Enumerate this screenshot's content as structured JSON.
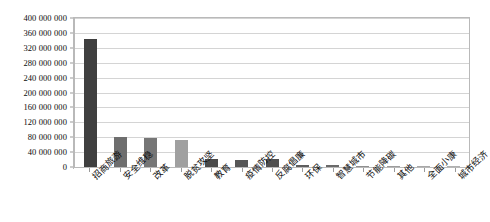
{
  "chart_data": {
    "type": "bar",
    "title": "",
    "subtitle": "",
    "xlabel": "",
    "ylabel": "",
    "categories": [
      "招商旅游",
      "安全维稳",
      "改革",
      "脱贫攻坚",
      "教育",
      "疫情防控",
      "反腐倡廉",
      "环保",
      "智慧城市",
      "节能降碳",
      "其他",
      "全面小康",
      "城市经济"
    ],
    "values": [
      345000000,
      80000000,
      79000000,
      73000000,
      21000000,
      20000000,
      21000000,
      6000000,
      4500000,
      1800000,
      900000,
      600000,
      400000
    ],
    "ylim": [
      0,
      400000000
    ],
    "ytick_step": 40000000,
    "ytick_labels": [
      "400 000 000",
      "360 000 000",
      "320 000 000",
      "280 000 000",
      "240 000 000",
      "200 000 000",
      "160 000 000",
      "120 000 000",
      "80 000 000",
      "40 000 000",
      "0"
    ],
    "ytick_values": [
      400000000,
      360000000,
      320000000,
      280000000,
      240000000,
      200000000,
      160000000,
      120000000,
      80000000,
      40000000,
      0
    ],
    "grid": "horizontal",
    "legend": "none",
    "bar_colors": [
      "#3f3f3f",
      "#6e6e6e",
      "#767676",
      "#a0a0a0",
      "#4a4a4a",
      "#565656",
      "#4f4f4f",
      "#5e5e5e",
      "#6a6a6a",
      "#8f8f8f",
      "#9c9c9c",
      "#a8a8a8",
      "#b0b0b0"
    ],
    "axis_color": "#b9b9b9",
    "gridline_color": "#d4d4d4",
    "text_color": "#0b0b0b",
    "background": "#ffffff"
  }
}
